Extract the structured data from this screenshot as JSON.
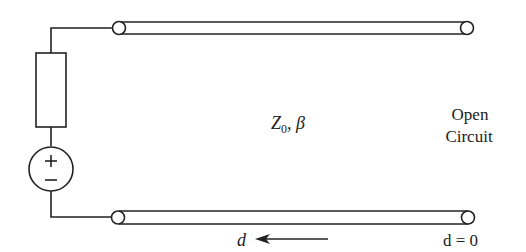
{
  "diagram": {
    "line_label": {
      "symbol": "Z",
      "subscript": "0",
      "rest": ", β"
    },
    "load_label": {
      "line1": "Open",
      "line2": "Circuit"
    },
    "position_label": "d",
    "origin_label": "d = 0",
    "source": {
      "plus": "+",
      "minus": "−"
    },
    "colors": {
      "stroke": "#222222",
      "background": "#ffffff"
    }
  }
}
